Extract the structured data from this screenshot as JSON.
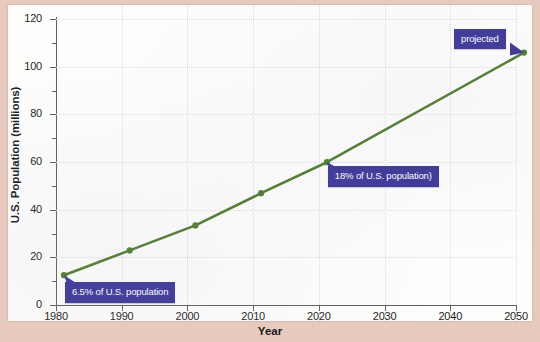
{
  "figure": {
    "y_axis_title": "U.S. Population (millions)",
    "x_axis_title": "Year"
  },
  "annotations": [
    {
      "id": "a1980",
      "text": "6.5% of U.S. population"
    },
    {
      "id": "a2020",
      "text": "18% of U.S. population)"
    },
    {
      "id": "a2050",
      "text": "projected"
    }
  ],
  "colors": {
    "line": "#4f7a2e",
    "callout": "#3b3696",
    "axis": "#5f5f5f",
    "paper": "#fdfdfc",
    "border": "#e8c9bd"
  },
  "chart_data": {
    "type": "line",
    "title": "",
    "xlabel": "Year",
    "ylabel": "U.S. Population (millions)",
    "x": [
      1980,
      1990,
      2000,
      2010,
      2020,
      2050
    ],
    "values": [
      14.6,
      25.0,
      35.5,
      49.0,
      62.0,
      108.0
    ],
    "xlim": [
      1980,
      2050
    ],
    "ylim": [
      0,
      120
    ],
    "xticks": [
      1980,
      1990,
      2000,
      2010,
      2020,
      2030,
      2040,
      2050
    ],
    "yticks": [
      0,
      20,
      40,
      60,
      80,
      100,
      120
    ],
    "y_minor_ticks": [
      10,
      30,
      50,
      70,
      90,
      110
    ],
    "grid": true,
    "legend": "none",
    "marker": "circle",
    "series_name": "U.S. Hispanic population"
  }
}
